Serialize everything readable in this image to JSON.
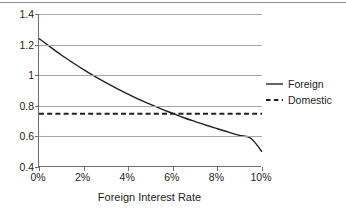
{
  "chart_data": {
    "type": "line",
    "title": "",
    "xlabel": "Foreign Interest Rate",
    "ylabel": "",
    "xlim": [
      0,
      10
    ],
    "ylim": [
      0.4,
      1.4
    ],
    "grid": true,
    "legend_position": "right",
    "x_ticklabels": [
      "0%",
      "2%",
      "4%",
      "6%",
      "8%",
      "10%"
    ],
    "x_tickvalues": [
      0,
      2,
      4,
      6,
      8,
      10
    ],
    "y_ticklabels": [
      "0.4",
      "0.6",
      "0.8",
      "1",
      "1.2",
      "1.4"
    ],
    "y_tickvalues": [
      0.4,
      0.6,
      0.8,
      1.0,
      1.2,
      1.4
    ],
    "series": [
      {
        "name": "Foreign",
        "style": "solid",
        "color": "#231f20",
        "x": [
          0,
          0.5,
          1,
          1.5,
          2,
          2.5,
          3,
          3.5,
          4,
          4.5,
          5,
          5.5,
          6,
          6.5,
          7,
          7.5,
          8,
          8.5,
          9,
          9.5,
          10
        ],
        "values": [
          1.24,
          1.185,
          1.132,
          1.083,
          1.036,
          0.992,
          0.951,
          0.912,
          0.876,
          0.841,
          0.809,
          0.778,
          0.75,
          0.722,
          0.697,
          0.673,
          0.65,
          0.628,
          0.607,
          0.588,
          0.5
        ]
      },
      {
        "name": "Domestic",
        "style": "dashed",
        "color": "#231f20",
        "x": [
          0,
          10
        ],
        "values": [
          0.748,
          0.748
        ]
      }
    ],
    "annotations": {
      "crossover_x": "5%",
      "crossover_y": 0.748
    }
  },
  "legend": {
    "items": [
      {
        "label": "Foreign",
        "swatch": "solid-line-swatch"
      },
      {
        "label": "Domestic",
        "swatch": "dashed-line-swatch"
      }
    ]
  },
  "axes": {
    "x_title": "Foreign Interest Rate"
  },
  "colors": {
    "series_line": "#231f20",
    "gridline": "#a6a6a6",
    "axis": "#6e6e6e",
    "background": "#ffffff",
    "top_rule": "#8c8c8c"
  }
}
